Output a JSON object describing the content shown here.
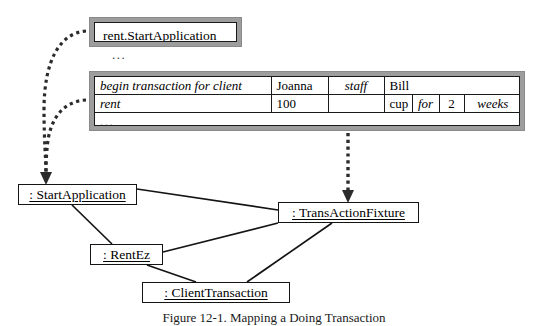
{
  "figure": {
    "caption_label": "Figure 12-1.",
    "caption_text": "Mapping a Doing Transaction"
  },
  "page_name_panel": {
    "name": "rent.StartApplication",
    "trailing_ellipsis": "..."
  },
  "fit_table": {
    "trailing_ellipsis": "...",
    "rows": [
      {
        "name": "row-begin-transaction",
        "cells": [
          {
            "name": "cell-begin-transaction-for-client",
            "text": "begin transaction for client",
            "style": "italic",
            "align": "left",
            "colspan": 1
          },
          {
            "name": "cell-joanna",
            "text": "Joanna",
            "style": "roman",
            "align": "left",
            "colspan": 1
          },
          {
            "name": "cell-staff",
            "text": "staff",
            "style": "italic",
            "align": "center",
            "colspan": 1
          },
          {
            "name": "cell-bill",
            "text": "Bill",
            "style": "roman",
            "align": "left",
            "colspan": 4
          }
        ]
      },
      {
        "name": "row-rent",
        "cells": [
          {
            "name": "cell-rent",
            "text": "rent",
            "style": "italic",
            "align": "left",
            "colspan": 1
          },
          {
            "name": "cell-100",
            "text": "100",
            "style": "roman",
            "align": "left",
            "colspan": 1
          },
          {
            "name": "cell-empty",
            "text": "",
            "style": "roman",
            "align": "left",
            "colspan": 1
          },
          {
            "name": "cell-cup",
            "text": "cup",
            "style": "roman",
            "align": "left",
            "colspan": 1
          },
          {
            "name": "cell-for",
            "text": "for",
            "style": "italic",
            "align": "center",
            "colspan": 1
          },
          {
            "name": "cell-2",
            "text": "2",
            "style": "roman",
            "align": "center",
            "colspan": 1
          },
          {
            "name": "cell-weeks",
            "text": "weeks",
            "style": "italic",
            "align": "center",
            "colspan": 1
          }
        ]
      },
      {
        "name": "row-ellipsis",
        "cells": [
          {
            "name": "cell-table-ellipsis",
            "text": "...",
            "style": "dots",
            "align": "left",
            "colspan": 7
          }
        ]
      }
    ]
  },
  "objects": [
    {
      "name": "object-startapplication",
      "label": ": StartApplication"
    },
    {
      "name": "object-transactionfixture",
      "label": ": TransActionFixture"
    },
    {
      "name": "object-rentez",
      "label": ": RentEz"
    },
    {
      "name": "object-clienttransaction",
      "label": ": ClientTransaction"
    }
  ],
  "colors": {
    "panel_frame": "#9d9d9d",
    "line": "#141414",
    "background": "#ffffff"
  }
}
